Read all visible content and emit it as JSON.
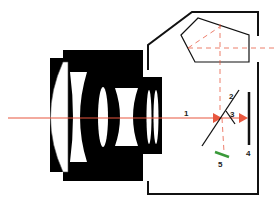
{
  "diagram": {
    "colors": {
      "lens": "#000000",
      "light_path": "#e8573f",
      "body_outline": "#111111",
      "secondary_sensor": "#3a9a3a"
    },
    "labels": [
      {
        "id": "1",
        "text": "1",
        "meaning": "light path through lens"
      },
      {
        "id": "2",
        "text": "2",
        "meaning": "main reflex mirror"
      },
      {
        "id": "3",
        "text": "3",
        "meaning": "secondary mirror"
      },
      {
        "id": "4",
        "text": "4",
        "meaning": "image sensor / film plane"
      },
      {
        "id": "5",
        "text": "5",
        "meaning": "autofocus sensor"
      }
    ],
    "components": [
      "lens-assembly",
      "camera-body",
      "pentaprism",
      "viewfinder-path",
      "reflex-mirror",
      "secondary-mirror",
      "image-sensor",
      "af-sensor",
      "optical-axis"
    ]
  }
}
